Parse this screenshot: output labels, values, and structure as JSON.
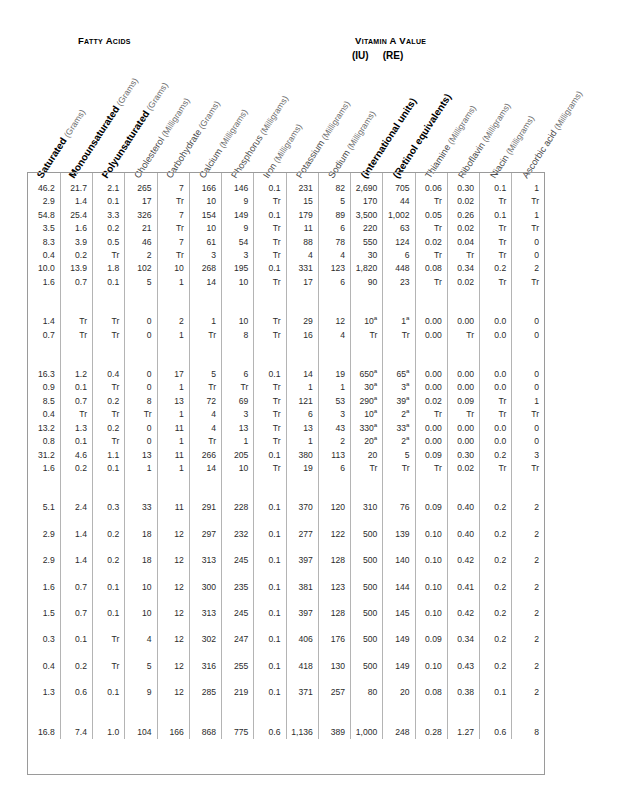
{
  "document": {
    "type": "nutritive-value-of-foods-table",
    "group_headers": {
      "fatty_acids": "Fatty Acids",
      "vitamin_a_value": "Vitamin A Value",
      "vitamin_a_iu": "(IU)",
      "vitamin_a_re": "(RE)"
    },
    "footnote_marker": "a"
  },
  "columns": [
    {
      "name": "Saturated",
      "unit": "(Grams)",
      "bold": true
    },
    {
      "name": "Monounsaturated",
      "unit": "(Grams)",
      "bold": true
    },
    {
      "name": "Polyunsaturated",
      "unit": "(Grams)",
      "bold": true
    },
    {
      "name": "Cholesterol",
      "unit": "(Milligrams)",
      "bold": false
    },
    {
      "name": "Carbohydrate",
      "unit": "(Grams)",
      "bold": false
    },
    {
      "name": "Calcium",
      "unit": "(Milligrams)",
      "bold": false
    },
    {
      "name": "Phosphorus",
      "unit": "(Milligrams)",
      "bold": false
    },
    {
      "name": "Iron",
      "unit": "(Milligrams)",
      "bold": false
    },
    {
      "name": "Potassium",
      "unit": "(Milligrams)",
      "bold": false
    },
    {
      "name": "Sodium",
      "unit": "(Milligrams)",
      "bold": false
    },
    {
      "name": "(International units)",
      "unit": "",
      "bold": true
    },
    {
      "name": "(Retinol equivalents)",
      "unit": "",
      "bold": true
    },
    {
      "name": "Thiamine",
      "unit": "(Milligrams)",
      "bold": false
    },
    {
      "name": "Riboflavin",
      "unit": "(Milligrams)",
      "bold": false
    },
    {
      "name": "Niacin",
      "unit": "(Milligrams)",
      "bold": false
    },
    {
      "name": "Ascorbic acid",
      "unit": "(Milligrams)",
      "bold": false
    }
  ],
  "row_groups": [
    {
      "rows": [
        [
          "46.2",
          "21.7",
          "2.1",
          "265",
          "7",
          "166",
          "146",
          "0.1",
          "231",
          "82",
          "2,690",
          "705",
          "0.06",
          "0.30",
          "0.1",
          "1"
        ],
        [
          "2.9",
          "1.4",
          "0.1",
          "17",
          "Tr",
          "10",
          "9",
          "Tr",
          "15",
          "5",
          "170",
          "44",
          "Tr",
          "0.02",
          "Tr",
          "Tr"
        ],
        [
          "54.8",
          "25.4",
          "3.3",
          "326",
          "7",
          "154",
          "149",
          "0.1",
          "179",
          "89",
          "3,500",
          "1,002",
          "0.05",
          "0.26",
          "0.1",
          "1"
        ],
        [
          "3.5",
          "1.6",
          "0.2",
          "21",
          "Tr",
          "10",
          "9",
          "Tr",
          "11",
          "6",
          "220",
          "63",
          "Tr",
          "0.02",
          "Tr",
          "Tr"
        ],
        [
          "8.3",
          "3.9",
          "0.5",
          "46",
          "7",
          "61",
          "54",
          "Tr",
          "88",
          "78",
          "550",
          "124",
          "0.02",
          "0.04",
          "Tr",
          "0"
        ],
        [
          "0.4",
          "0.2",
          "Tr",
          "2",
          "Tr",
          "3",
          "3",
          "Tr",
          "4",
          "4",
          "30",
          "6",
          "Tr",
          "Tr",
          "Tr",
          "0"
        ],
        [
          "10.0",
          "13.9",
          "1.8",
          "102",
          "10",
          "268",
          "195",
          "0.1",
          "331",
          "123",
          "1,820",
          "448",
          "0.08",
          "0.34",
          "0.2",
          "2"
        ],
        [
          "1.6",
          "0.7",
          "0.1",
          "5",
          "1",
          "14",
          "10",
          "Tr",
          "17",
          "6",
          "90",
          "23",
          "Tr",
          "0.02",
          "Tr",
          "Tr"
        ]
      ]
    },
    {
      "rows": [
        [
          "1.4",
          "Tr",
          "Tr",
          "0",
          "2",
          "1",
          "10",
          "Tr",
          "29",
          "12",
          "10a",
          "1a",
          "0.00",
          "0.00",
          "0.0",
          "0"
        ],
        [
          "0.7",
          "Tr",
          "Tr",
          "0",
          "1",
          "Tr",
          "8",
          "Tr",
          "16",
          "4",
          "Tr",
          "Tr",
          "0.00",
          "Tr",
          "0.0",
          "0"
        ]
      ]
    },
    {
      "rows": [
        [
          "16.3",
          "1.2",
          "0.4",
          "0",
          "17",
          "5",
          "6",
          "0.1",
          "14",
          "19",
          "650a",
          "65a",
          "0.00",
          "0.00",
          "0.0",
          "0"
        ],
        [
          "0.9",
          "0.1",
          "Tr",
          "0",
          "1",
          "Tr",
          "Tr",
          "Tr",
          "1",
          "1",
          "30a",
          "3a",
          "0.00",
          "0.00",
          "0.0",
          "0"
        ],
        [
          "8.5",
          "0.7",
          "0.2",
          "8",
          "13",
          "72",
          "69",
          "Tr",
          "121",
          "53",
          "290a",
          "39a",
          "0.02",
          "0.09",
          "Tr",
          "1"
        ],
        [
          "0.4",
          "Tr",
          "Tr",
          "Tr",
          "1",
          "4",
          "3",
          "Tr",
          "6",
          "3",
          "10a",
          "2a",
          "Tr",
          "Tr",
          "Tr",
          "Tr"
        ],
        [
          "13.2",
          "1.3",
          "0.2",
          "0",
          "11",
          "4",
          "13",
          "Tr",
          "13",
          "43",
          "330a",
          "33a",
          "0.00",
          "0.00",
          "0.0",
          "0"
        ],
        [
          "0.8",
          "0.1",
          "Tr",
          "0",
          "1",
          "Tr",
          "1",
          "Tr",
          "1",
          "2",
          "20a",
          "2a",
          "0.00",
          "0.00",
          "0.0",
          "0"
        ],
        [
          "31.2",
          "4.6",
          "1.1",
          "13",
          "11",
          "266",
          "205",
          "0.1",
          "380",
          "113",
          "20",
          "5",
          "0.09",
          "0.30",
          "0.2",
          "3"
        ],
        [
          "1.6",
          "0.2",
          "0.1",
          "1",
          "1",
          "14",
          "10",
          "Tr",
          "19",
          "6",
          "Tr",
          "Tr",
          "Tr",
          "0.02",
          "Tr",
          "Tr"
        ]
      ]
    },
    {
      "rows": [
        [
          "5.1",
          "2.4",
          "0.3",
          "33",
          "11",
          "291",
          "228",
          "0.1",
          "370",
          "120",
          "310",
          "76",
          "0.09",
          "0.40",
          "0.2",
          "2"
        ],
        [
          "2.9",
          "1.4",
          "0.2",
          "18",
          "12",
          "297",
          "232",
          "0.1",
          "277",
          "122",
          "500",
          "139",
          "0.10",
          "0.40",
          "0.2",
          "2"
        ],
        [
          "2.9",
          "1.4",
          "0.2",
          "18",
          "12",
          "313",
          "245",
          "0.1",
          "397",
          "128",
          "500",
          "140",
          "0.10",
          "0.42",
          "0.2",
          "2"
        ],
        [
          "1.6",
          "0.7",
          "0.1",
          "10",
          "12",
          "300",
          "235",
          "0.1",
          "381",
          "123",
          "500",
          "144",
          "0.10",
          "0.41",
          "0.2",
          "2"
        ],
        [
          "1.5",
          "0.7",
          "0.1",
          "10",
          "12",
          "313",
          "245",
          "0.1",
          "397",
          "128",
          "500",
          "145",
          "0.10",
          "0.42",
          "0.2",
          "2"
        ],
        [
          "0.3",
          "0.1",
          "Tr",
          "4",
          "12",
          "302",
          "247",
          "0.1",
          "406",
          "176",
          "500",
          "149",
          "0.09",
          "0.34",
          "0.2",
          "2"
        ],
        [
          "0.4",
          "0.2",
          "Tr",
          "5",
          "12",
          "316",
          "255",
          "0.1",
          "418",
          "130",
          "500",
          "149",
          "0.10",
          "0.43",
          "0.2",
          "2"
        ],
        [
          "1.3",
          "0.6",
          "0.1",
          "9",
          "12",
          "285",
          "219",
          "0.1",
          "371",
          "257",
          "80",
          "20",
          "0.08",
          "0.38",
          "0.1",
          "2"
        ]
      ]
    },
    {
      "rows": [
        [
          "16.8",
          "7.4",
          "1.0",
          "104",
          "166",
          "868",
          "775",
          "0.6",
          "1,136",
          "389",
          "1,000",
          "248",
          "0.28",
          "1.27",
          "0.6",
          "8"
        ]
      ]
    }
  ]
}
